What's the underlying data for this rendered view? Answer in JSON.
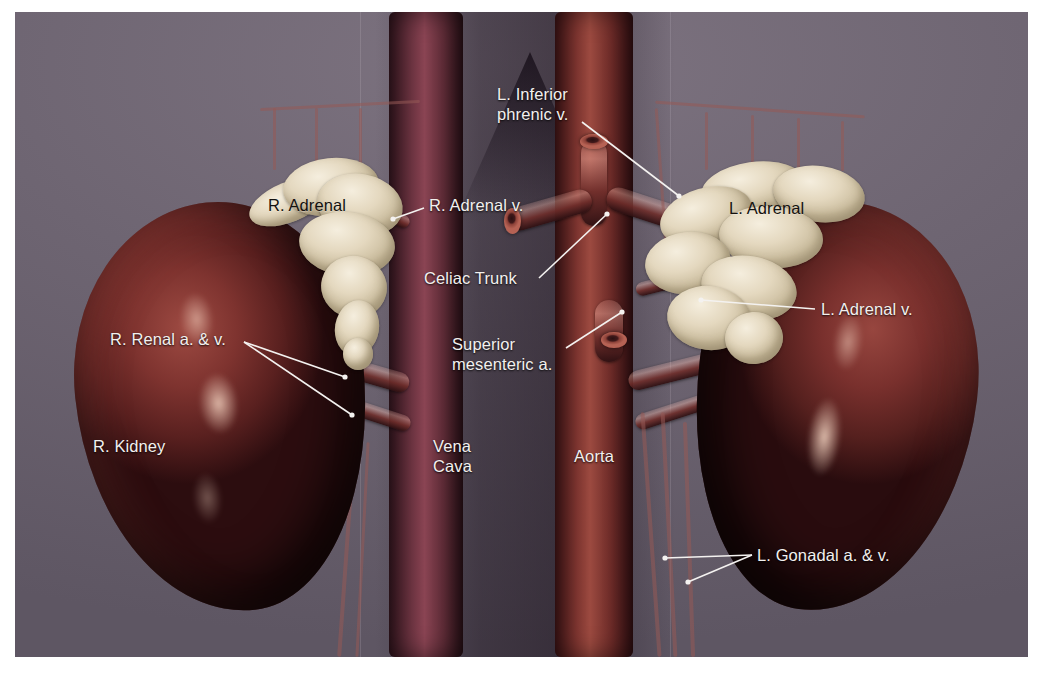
{
  "figure": {
    "type": "anatomical-illustration",
    "view": "anterior",
    "background_color": "#6e6572",
    "label_light_color": "#f2f0ee",
    "label_dark_color": "#14110f",
    "leader_color": "#f4f2f0",
    "kidney_color": "#7e332f",
    "adrenal_color": "#e4d8bf",
    "aorta_color": "#8b3c35",
    "cava_color": "#7b3a47"
  },
  "labels": [
    {
      "id": "l-inferior-phrenic-v",
      "text": "L. Inferior\nphrenic v.",
      "style": "light",
      "x": 482,
      "y": 72,
      "align": "left",
      "leaders": [
        {
          "x1": 567,
          "y1": 110,
          "x2": 664,
          "y2": 184
        }
      ]
    },
    {
      "id": "r-adrenal",
      "text": "R. Adrenal",
      "style": "dark",
      "x": 253,
      "y": 183,
      "align": "left",
      "leaders": []
    },
    {
      "id": "r-adrenal-v",
      "text": "R. Adrenal v.",
      "style": "light",
      "x": 414,
      "y": 183,
      "align": "left",
      "leaders": [
        {
          "x1": 409,
          "y1": 196,
          "x2": 378,
          "y2": 207
        }
      ]
    },
    {
      "id": "l-adrenal",
      "text": "L. Adrenal",
      "style": "dark",
      "x": 714,
      "y": 186,
      "align": "left",
      "leaders": []
    },
    {
      "id": "celiac-trunk",
      "text": "Celiac Trunk",
      "style": "light",
      "x": 409,
      "y": 256,
      "align": "left",
      "leaders": [
        {
          "x1": 524,
          "y1": 266,
          "x2": 592,
          "y2": 202
        }
      ]
    },
    {
      "id": "l-adrenal-v",
      "text": "L. Adrenal v.",
      "style": "light",
      "x": 806,
      "y": 287,
      "align": "left",
      "leaders": [
        {
          "x1": 800,
          "y1": 297,
          "x2": 686,
          "y2": 288
        }
      ]
    },
    {
      "id": "r-renal-a-v",
      "text": "R. Renal a. & v.",
      "style": "light",
      "x": 95,
      "y": 317,
      "align": "left",
      "leaders": [
        {
          "x1": 229,
          "y1": 330,
          "x2": 330,
          "y2": 365
        },
        {
          "x1": 229,
          "y1": 330,
          "x2": 337,
          "y2": 403
        }
      ]
    },
    {
      "id": "superior-mesenteric-a",
      "text": "Superior\nmesenteric a.",
      "style": "light",
      "x": 437,
      "y": 322,
      "align": "left",
      "leaders": [
        {
          "x1": 551,
          "y1": 336,
          "x2": 607,
          "y2": 300
        }
      ]
    },
    {
      "id": "r-kidney",
      "text": "R. Kidney",
      "style": "light",
      "x": 78,
      "y": 424,
      "align": "left",
      "leaders": []
    },
    {
      "id": "vena-cava",
      "text": "Vena\nCava",
      "style": "light",
      "x": 418,
      "y": 424,
      "align": "left",
      "leaders": []
    },
    {
      "id": "aorta",
      "text": "Aorta",
      "style": "light",
      "x": 559,
      "y": 434,
      "align": "left",
      "leaders": []
    },
    {
      "id": "l-gonadal-a-v",
      "text": "L. Gonadal a. & v.",
      "style": "light",
      "x": 742,
      "y": 533,
      "align": "left",
      "leaders": [
        {
          "x1": 737,
          "y1": 543,
          "x2": 650,
          "y2": 546
        },
        {
          "x1": 737,
          "y1": 543,
          "x2": 673,
          "y2": 570
        }
      ]
    }
  ],
  "structures": [
    {
      "name": "Right kidney",
      "side": "right"
    },
    {
      "name": "Left kidney",
      "side": "left"
    },
    {
      "name": "Right adrenal gland",
      "side": "right"
    },
    {
      "name": "Left adrenal gland",
      "side": "left"
    },
    {
      "name": "Abdominal aorta",
      "side": "midline"
    },
    {
      "name": "Inferior vena cava",
      "side": "midline"
    },
    {
      "name": "Celiac trunk",
      "side": "midline"
    },
    {
      "name": "Superior mesenteric artery",
      "side": "midline"
    },
    {
      "name": "Renal arteries and veins",
      "side": "bilateral"
    },
    {
      "name": "Gonadal arteries and veins",
      "side": "bilateral"
    },
    {
      "name": "Inferior phrenic veins",
      "side": "bilateral"
    },
    {
      "name": "Ureters",
      "side": "bilateral"
    }
  ]
}
